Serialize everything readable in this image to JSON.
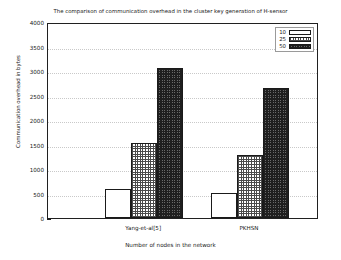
{
  "chart_data": {
    "type": "bar",
    "title": "The comparison of communication overhead in the cluster key generation of H-sensor",
    "xlabel": "Number of nodes in the network",
    "ylabel": "Communication overhead in bytes",
    "categories": [
      "Yang-et-al[5]",
      "PKHSN"
    ],
    "series": [
      {
        "name": "10",
        "values": [
          600,
          520
        ],
        "pattern": "empty"
      },
      {
        "name": "25",
        "values": [
          1530,
          1280
        ],
        "pattern": "check-light"
      },
      {
        "name": "50",
        "values": [
          3060,
          2650
        ],
        "pattern": "check-dark"
      }
    ],
    "ylim": [
      0,
      4000
    ],
    "ytick_step": 500,
    "yticks": [
      "0",
      "500",
      "1000",
      "1500",
      "2000",
      "2500",
      "3000",
      "3500",
      "4000"
    ],
    "grid": true,
    "legend_position": "top-right",
    "colors": {
      "axis": "#202020",
      "grid": "#c9c9c9",
      "bar_edge": "#1a1a1a",
      "background": "#ffffff"
    }
  }
}
